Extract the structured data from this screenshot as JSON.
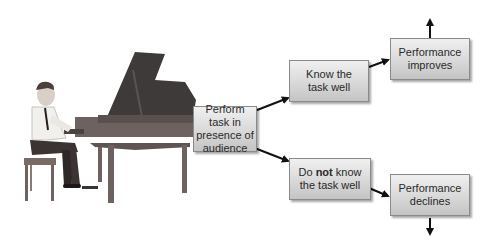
{
  "diagram": {
    "illustration": "man-playing-grand-piano",
    "nodes": {
      "start": {
        "lines": [
          "Perform task in",
          "presence of",
          "audience"
        ]
      },
      "know": {
        "lines": [
          "Know the",
          "task well"
        ]
      },
      "notknow": {
        "line1_pre": "Do ",
        "line1_bold": "not",
        "line1_post": " know",
        "line2": "the task well"
      },
      "improves": {
        "lines": [
          "Performance",
          "improves"
        ]
      },
      "declines": {
        "lines": [
          "Performance",
          "declines"
        ]
      }
    },
    "edges": [
      {
        "from": "start",
        "to": "know"
      },
      {
        "from": "start",
        "to": "notknow"
      },
      {
        "from": "know",
        "to": "improves"
      },
      {
        "from": "notknow",
        "to": "declines"
      },
      {
        "from": "improves",
        "to": "up"
      },
      {
        "from": "declines",
        "to": "down"
      }
    ]
  }
}
